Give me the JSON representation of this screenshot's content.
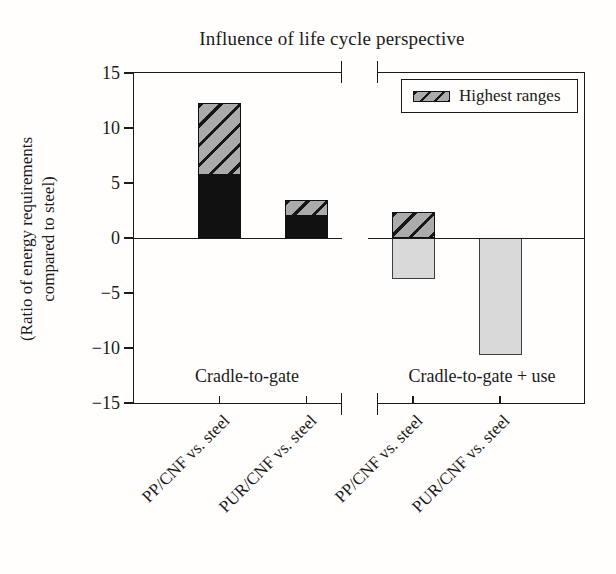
{
  "title": "Influence of life cycle perspective",
  "y_axis": {
    "label_line1": "(Ratio of energy requirements",
    "label_line2": "compared to steel)",
    "tick_labels": [
      "15",
      "10",
      "5",
      "0",
      "−5",
      "−10",
      "−15"
    ]
  },
  "legend": {
    "label": "Highest ranges"
  },
  "colors": {
    "bar_black": "#111111",
    "hatch_background": "#ababab",
    "hatch_line": "#161616",
    "bar_light_gray": "#d9d9d9",
    "axis": "#1a1a1a"
  },
  "chart_data": {
    "type": "bar",
    "stacked": true,
    "title": "Influence of life cycle perspective",
    "ylabel": "(Ratio of energy requirements compared to steel)",
    "ylim": [
      -15,
      15
    ],
    "yticks": [
      15,
      10,
      5,
      0,
      -5,
      -10,
      -15
    ],
    "grid": false,
    "legend": [
      "Highest ranges"
    ],
    "legend_position": "upper right",
    "legend_style": "diagonal-hatch",
    "panels": [
      {
        "label": "Cradle-to-gate",
        "bars": [
          {
            "category": "PP/CNF vs. steel",
            "segments": [
              {
                "from": 0,
                "to": 5.7,
                "style": "black",
                "meaning": "base estimate"
              },
              {
                "from": 5.7,
                "to": 12.3,
                "style": "hatch",
                "meaning": "highest ranges"
              }
            ]
          },
          {
            "category": "PUR/CNF vs. steel",
            "segments": [
              {
                "from": 0,
                "to": 2.0,
                "style": "black",
                "meaning": "base estimate"
              },
              {
                "from": 2.0,
                "to": 3.5,
                "style": "hatch",
                "meaning": "highest ranges"
              }
            ]
          }
        ]
      },
      {
        "label": "Cradle-to-gate + use",
        "bars": [
          {
            "category": "PP/CNF vs. steel",
            "segments": [
              {
                "from": -3.7,
                "to": 0,
                "style": "gray",
                "meaning": "base estimate"
              },
              {
                "from": 0,
                "to": 2.4,
                "style": "hatch",
                "meaning": "highest ranges"
              }
            ]
          },
          {
            "category": "PUR/CNF vs. steel",
            "segments": [
              {
                "from": -10.6,
                "to": 0,
                "style": "gray",
                "meaning": "base estimate"
              }
            ]
          }
        ]
      }
    ]
  }
}
